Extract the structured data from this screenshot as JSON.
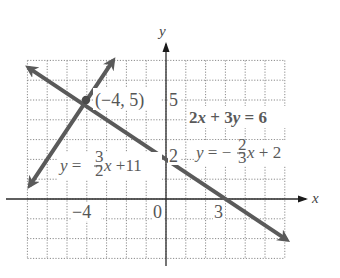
{
  "chart_data": {
    "type": "line",
    "title": "",
    "xlabel": "x",
    "ylabel": "y",
    "xlim": [
      -7,
      7
    ],
    "ylim": [
      -3,
      7
    ],
    "grid": true,
    "grid_step": 1,
    "x_tick_labels": [
      {
        "value": -4,
        "label": "−4"
      },
      {
        "value": 0,
        "label": "0"
      },
      {
        "value": 3,
        "label": "3"
      }
    ],
    "y_tick_labels": [
      {
        "value": 5,
        "label": "5"
      },
      {
        "value": 2,
        "label": "2"
      }
    ],
    "series": [
      {
        "name": "y = -2/3 x + 2",
        "equation_standard": "2x + 3y = 6",
        "equation_slope_intercept": "y = −(2/3)x + 2",
        "slope": -0.6667,
        "intercept": 2,
        "x": [
          -6.9,
          6.05
        ],
        "y": [
          6.6,
          -2.03
        ],
        "arrows": "both",
        "color": "#5a5a5a"
      },
      {
        "name": "y = 3/2 x + 11",
        "equation_slope_intercept": "y = (3/2)x + 11",
        "slope": 1.5,
        "intercept": 11,
        "x": [
          -6.85,
          -2.7
        ],
        "y": [
          0.725,
          6.95
        ],
        "arrows": "both",
        "color": "#5a5a5a"
      }
    ],
    "points": [
      {
        "x": -4,
        "y": 5,
        "label": "(−4, 5)",
        "note": "intersection point"
      }
    ],
    "annotations": [
      "(−4, 5)",
      "2x + 3y = 6",
      "y = −(2/3)x + 2",
      "y = (3/2)x + 11"
    ]
  },
  "labels": {
    "y_axis": "y",
    "x_axis": "x",
    "x_tick_neg4": "−4",
    "x_tick_0": "0",
    "x_tick_3": "3",
    "y_tick_5": "5",
    "y_tick_2": "2",
    "point_label": "(−4, 5)",
    "eq_standard": {
      "coef_x": "2",
      "var_x": "x",
      "plus": " + 3",
      "var_y": "y",
      "rhs": " = 6"
    },
    "eq_descending": {
      "lhs_var": "y",
      "eq": " = −",
      "num": "2",
      "den": "3",
      "var_x": "x",
      "rest": " + 2"
    },
    "eq_ascending": {
      "lhs_var": "y",
      "eq": " = ",
      "num": "3",
      "den": "2",
      "var_x": "x",
      "rest": " +11"
    }
  }
}
